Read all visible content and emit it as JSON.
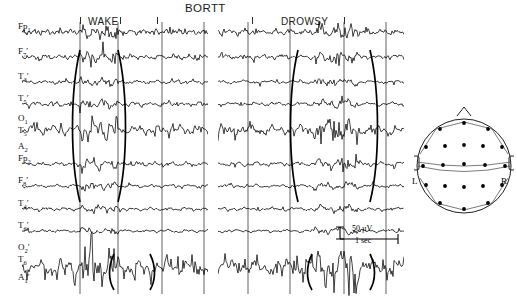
{
  "figure": {
    "title": "BORTT",
    "panels": [
      {
        "name": "wake",
        "label": "WAKE"
      },
      {
        "name": "drowsy",
        "label": "DROWSY"
      }
    ]
  },
  "channels": [
    {
      "id": "fp1",
      "base": "Fp",
      "sub": "1",
      "prime": false,
      "y": 32
    },
    {
      "id": "f7p",
      "base": "F",
      "sub": "7",
      "prime": true,
      "y": 57
    },
    {
      "id": "t3p",
      "base": "T",
      "sub": "3",
      "prime": true,
      "y": 82
    },
    {
      "id": "t5p",
      "base": "T",
      "sub": "5",
      "prime": true,
      "y": 104
    },
    {
      "id": "o1",
      "base": "O",
      "sub": "1",
      "prime": false,
      "y": 124
    },
    {
      "id": "t5",
      "base": "T",
      "sub": "5",
      "prime": false,
      "y": 136
    },
    {
      "id": "a2",
      "base": "A",
      "sub": "2",
      "prime": false,
      "y": 152
    },
    {
      "id": "fp2",
      "base": "Fp",
      "sub": "2",
      "prime": false,
      "y": 164
    },
    {
      "id": "f8p",
      "base": "F",
      "sub": "8",
      "prime": true,
      "y": 186
    },
    {
      "id": "t4p",
      "base": "T",
      "sub": "4",
      "prime": true,
      "y": 209
    },
    {
      "id": "t6p",
      "base": "T",
      "sub": "6",
      "prime": true,
      "y": 231
    },
    {
      "id": "o2p",
      "base": "O",
      "sub": "2",
      "prime": true,
      "y": 253
    },
    {
      "id": "t6",
      "base": "T",
      "sub": "6",
      "prime": false,
      "y": 265
    },
    {
      "id": "a1p",
      "base": "A",
      "sub": "1",
      "prime": true,
      "y": 283
    }
  ],
  "calibration": {
    "amplitude": "50 µV",
    "duration": "1 sec"
  },
  "head_map": {
    "left_label": "L",
    "right_label": "R",
    "electrode_count": 21
  },
  "chart_data": {
    "type": "line",
    "title": "BORTT",
    "xlabel": "",
    "ylabel": "",
    "grid": false,
    "legend": "none",
    "calibration_amplitude_uv": 50,
    "calibration_duration_sec": 1,
    "trace_rows": [
      "Fp1",
      "F7'",
      "T3'",
      "T5'",
      "O1 / T5 / A2",
      "Fp2",
      "F8'",
      "T4'",
      "T6' / O2'",
      "T6 / A1'"
    ],
    "series": [
      {
        "name": "WAKE",
        "rows": 10,
        "time_markers": 4,
        "bracket_pairs": 2
      },
      {
        "name": "DROWSY",
        "rows": 10,
        "time_markers": 4,
        "bracket_pairs": 2
      }
    ]
  }
}
